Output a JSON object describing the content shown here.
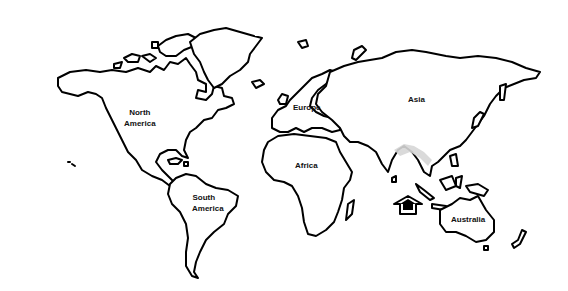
{
  "map": {
    "title": "World Map Outline",
    "line_color": "#000000",
    "highlight_color": "#d6d6d6",
    "continents": [
      {
        "id": "north-america",
        "line1": "North",
        "line2": "America"
      },
      {
        "id": "south-america",
        "line1": "South",
        "line2": "America"
      },
      {
        "id": "europe",
        "line1": "Europe"
      },
      {
        "id": "africa",
        "line1": "Africa"
      },
      {
        "id": "asia",
        "line1": "Asia"
      },
      {
        "id": "australia",
        "line1": "Australia"
      }
    ],
    "marker": {
      "icon": "house-icon",
      "location": "Indian Ocean, south of Indonesia"
    },
    "highlight_region": "Himalaya / Southeast Asia"
  }
}
